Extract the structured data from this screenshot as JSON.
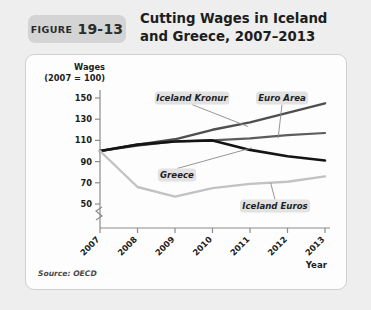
{
  "figure": {
    "badge_word": "FIGURE",
    "badge_number": "19-13",
    "title_line1": "Cutting Wages in Iceland",
    "title_line2": "and Greece, 2007–2013",
    "source": "Source: OECD"
  },
  "colors": {
    "page_background": "#eeeeee",
    "panel_background": "#fdfdfd",
    "badge_background": "#d4d4d4",
    "callout_background": "#e2e2e2",
    "greece": "#141414",
    "iceland_kronur": "#4e4e4e",
    "euro_area": "#5c5c5c",
    "iceland_euros": "#c2c2c2",
    "axis": "#8c8c8c"
  },
  "chart_data": {
    "type": "line",
    "title": "Cutting Wages in Iceland and Greece, 2007–2013",
    "xlabel": "Year",
    "ylabel": "Wages (2007 = 100)",
    "ylabel_line1": "Wages",
    "ylabel_line2": "(2007 = 100)",
    "x": [
      2007,
      2008,
      2009,
      2010,
      2011,
      2012,
      2013
    ],
    "categories": [
      "2007",
      "2008",
      "2009",
      "2010",
      "2011",
      "2012",
      "2013"
    ],
    "yticks": [
      50,
      70,
      90,
      110,
      130,
      150
    ],
    "ylim": [
      42,
      158
    ],
    "axis_break": true,
    "grid": false,
    "legend_position": "inline-callouts",
    "series": [
      {
        "name": "Iceland Kronur",
        "color": "#4e4e4e",
        "values": [
          100,
          106,
          111,
          120,
          127,
          136,
          145
        ]
      },
      {
        "name": "Euro Area",
        "color": "#5c5c5c",
        "values": [
          100,
          105,
          109,
          110,
          112,
          115,
          117
        ]
      },
      {
        "name": "Greece",
        "color": "#141414",
        "values": [
          100,
          106,
          109,
          110,
          101,
          95,
          91
        ]
      },
      {
        "name": "Iceland Euros",
        "color": "#c2c2c2",
        "values": [
          100,
          66,
          57,
          65,
          69,
          71,
          76
        ]
      }
    ],
    "annotations": [
      {
        "label": "Iceland Kronur",
        "series": "Iceland Kronur"
      },
      {
        "label": "Euro Area",
        "series": "Euro Area"
      },
      {
        "label": "Greece",
        "series": "Greece"
      },
      {
        "label": "Iceland Euros",
        "series": "Iceland Euros"
      }
    ]
  }
}
